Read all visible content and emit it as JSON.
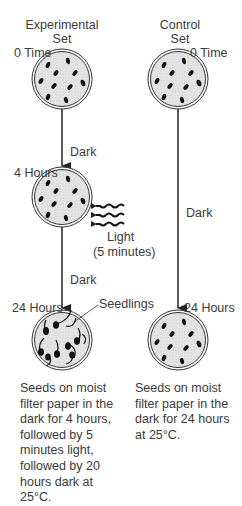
{
  "experimental": {
    "title_line1": "Experimental",
    "title_line2": "Set",
    "time_0": "0 Time",
    "step1_condition": "Dark",
    "time_4": "4 Hours",
    "light_label": "Light",
    "light_duration": "(5 minutes)",
    "step2_condition": "Dark",
    "time_24": "24 Hours",
    "seedlings_label": "Seedlings",
    "caption": "Seeds on moist\nfilter paper in the\ndark for 4 hours,\nfollowed by 5\nminutes light,\nfollowed by 20\nhours dark at\n25°C."
  },
  "control": {
    "title_line1": "Control",
    "title_line2": "Set",
    "time_0": "0 Time",
    "step_condition": "Dark",
    "time_24": "24 Hours",
    "caption": "Seeds on moist\nfilter paper in the\ndark for 24 hours\nat 25°C."
  },
  "colors": {
    "dish_fill": "#e6e6e6",
    "dish_outline": "#333333",
    "seed": "#111111",
    "arrow": "#222222"
  }
}
